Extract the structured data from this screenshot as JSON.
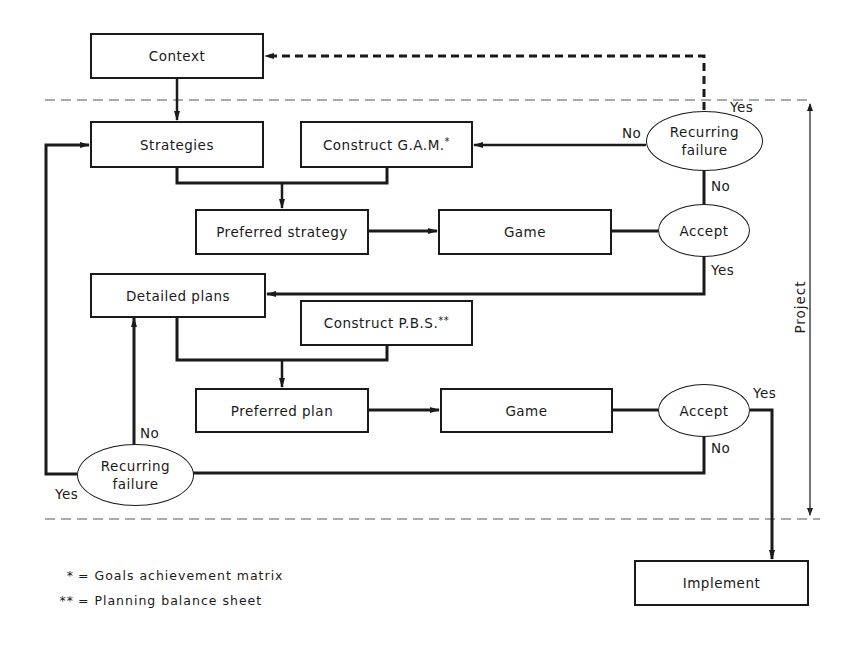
{
  "diagram": {
    "nodes": {
      "context": "Context",
      "strategies": "Strategies",
      "construct_gam": "Construct G.A.M.",
      "construct_gam_mark": "*",
      "recurring_failure_top_line1": "Recurring",
      "recurring_failure_top_line2": "failure",
      "preferred_strategy": "Preferred strategy",
      "game_top": "Game",
      "accept_top": "Accept",
      "detailed_plans": "Detailed plans",
      "construct_pbs": "Construct P.B.S.",
      "construct_pbs_mark": "**",
      "preferred_plan": "Preferred plan",
      "game_bottom": "Game",
      "accept_bottom": "Accept",
      "recurring_failure_bottom_line1": "Recurring",
      "recurring_failure_bottom_line2": "failure",
      "implement": "Implement"
    },
    "edge_labels": {
      "top_rf_yes": "Yes",
      "top_rf_no_left": "No",
      "top_rf_no_down": "No",
      "top_accept_yes": "Yes",
      "bottom_accept_yes": "Yes",
      "bottom_accept_no": "No",
      "bottom_rf_no": "No",
      "bottom_rf_yes": "Yes"
    },
    "bracket_label": "Project",
    "legend": [
      {
        "mark": "*",
        "text": "= Goals achievement matrix"
      },
      {
        "mark": "**",
        "text": "= Planning balance sheet"
      }
    ]
  }
}
